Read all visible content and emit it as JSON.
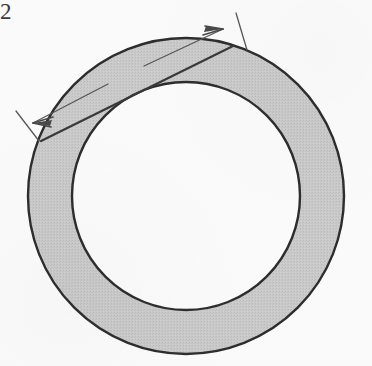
{
  "figure": {
    "kind": "geometry-diagram",
    "width": 372,
    "height": 366,
    "background_color": "#fbfbfb"
  },
  "annulus": {
    "name": "annulus",
    "center_x": 186,
    "center_y": 196,
    "outer_radius": 158,
    "inner_radius": 114,
    "band_width": 44,
    "fill_color": "#c9c9c9",
    "inner_fill_color": "#fbfbfb",
    "stroke_color": "#2e2e2e",
    "stroke_width": 2.4
  },
  "chord": {
    "name": "tangent-chord",
    "x1": 41,
    "y1": 141,
    "x2": 233,
    "y2": 46,
    "stroke_color": "#3a3a3a",
    "stroke_width": 2.2,
    "description": "chord of the outer circle tangent to the inner circle"
  },
  "dimension": {
    "name": "dimension-line",
    "label": "2",
    "label_x": 116,
    "label_y": 67,
    "x1": 33,
    "y1": 123,
    "x2": 223,
    "y2": 29,
    "gap_start_x": 108,
    "gap_start_y": 84,
    "gap_end_x": 144,
    "gap_end_y": 66,
    "stroke_color": "#585858",
    "stroke_width": 1.3,
    "arrow_color": "#4a4a4a",
    "extension_ticks": [
      {
        "name": "left-extension-tick",
        "x1": 16,
        "y1": 111,
        "x2": 39,
        "y2": 141
      },
      {
        "name": "right-extension-tick",
        "x1": 236,
        "y1": 13,
        "x2": 247,
        "y2": 50
      }
    ]
  },
  "text": {
    "chord_length_label": "2"
  }
}
